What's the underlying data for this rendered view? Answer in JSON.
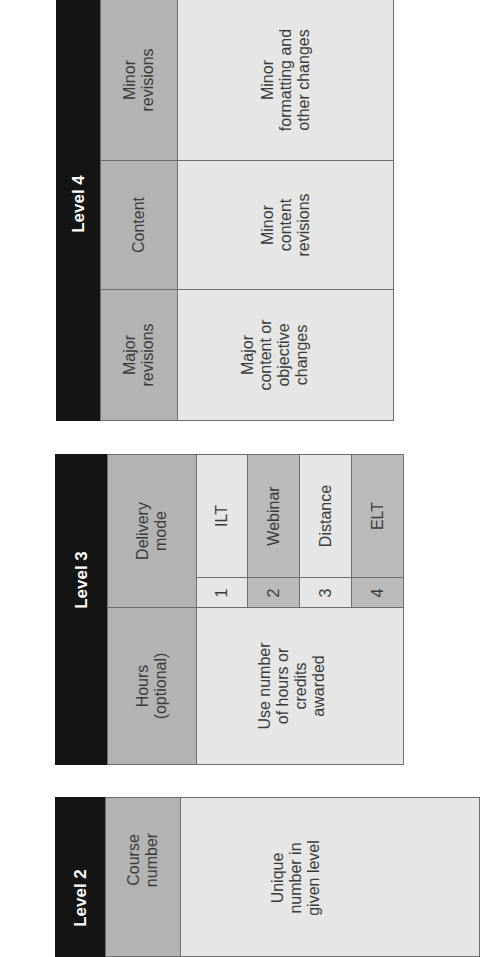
{
  "tables": [
    {
      "level_label": "Level 4",
      "rows": [
        {
          "header": "Minor\nrevisions",
          "description": "Minor\nformatting and\nother changes"
        },
        {
          "header": "Content",
          "description": "Minor\ncontent\nrevisions"
        },
        {
          "header": "Major\nrevisions",
          "description": "Major\ncontent or\nobjective\nchanges"
        }
      ]
    },
    {
      "level_label": "Level 3",
      "rows": [
        {
          "header": "Delivery\nmode",
          "options": [
            {
              "number": "1",
              "label": "ILT"
            },
            {
              "number": "2",
              "label": "Webinar"
            },
            {
              "number": "3",
              "label": "Distance"
            },
            {
              "number": "4",
              "label": "ELT"
            }
          ]
        },
        {
          "header": "Hours\n(optional)",
          "description": "Use number\nof hours or\ncredits\nawarded"
        }
      ]
    },
    {
      "level_label": "Level 2",
      "rows": [
        {
          "header": "Course\nnumber",
          "description": "Unique\nnumber in\ngiven level"
        }
      ]
    }
  ],
  "colors": {
    "level_header": "#141414",
    "column_header": "#b3b3b3",
    "cell_light": "#e6e6e6",
    "cell_dark": "#bababa"
  }
}
